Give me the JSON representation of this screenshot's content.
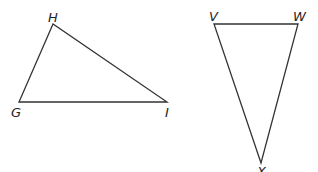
{
  "triangles": [
    {
      "name": "GHI",
      "vertices": [
        {
          "label": "H",
          "x": 53,
          "y": 24,
          "lx": 48,
          "ly": 22
        },
        {
          "label": "G",
          "x": 19,
          "y": 102,
          "lx": 11,
          "ly": 117
        },
        {
          "label": "I",
          "x": 167,
          "y": 102,
          "lx": 165,
          "ly": 117
        }
      ]
    },
    {
      "name": "VWX",
      "vertices": [
        {
          "label": "V",
          "x": 214,
          "y": 24,
          "lx": 209,
          "ly": 21
        },
        {
          "label": "W",
          "x": 298,
          "y": 24,
          "lx": 293,
          "ly": 21
        },
        {
          "label": "X",
          "x": 261,
          "y": 163,
          "lx": 257,
          "ly": 176
        }
      ]
    }
  ],
  "colors": {
    "stroke": "#333333",
    "label": "#222222",
    "background": "#ffffff"
  }
}
